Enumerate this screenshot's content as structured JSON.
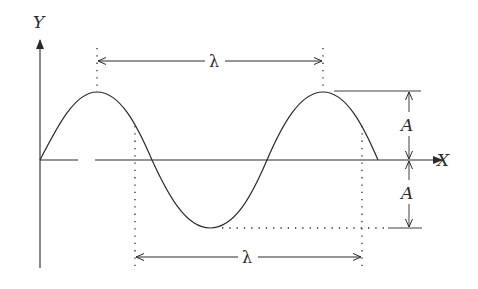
{
  "diagram": {
    "type": "wave-diagram",
    "colors": {
      "ink": "#2a2a2a",
      "background": "#ffffff"
    },
    "axes": {
      "y_label": "Y",
      "x_label": "X"
    },
    "annotations": {
      "wavelength_top": "λ",
      "wavelength_bottom": "λ",
      "amplitude_top": "A",
      "amplitude_bottom": "A"
    },
    "wave": {
      "cycles_shown": 1.5,
      "start": "origin",
      "description": "Sine curve starting at origin, peak, trough, peak, returning to axis"
    }
  }
}
